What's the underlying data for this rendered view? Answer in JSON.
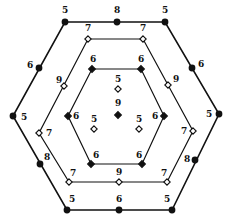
{
  "diagram": {
    "title": "",
    "rings": [
      {
        "name": "outer-hexagon",
        "marker": "filled-circle",
        "vertices": [
          [
            65,
            22
          ],
          [
            165,
            22
          ],
          [
            219,
            114
          ],
          [
            172,
            210
          ],
          [
            67,
            210
          ],
          [
            13,
            116
          ]
        ],
        "nodes": [
          {
            "x": 65,
            "y": 22,
            "label": "5",
            "lx": 62,
            "ly": 13
          },
          {
            "x": 117,
            "y": 22,
            "label": "8",
            "lx": 114,
            "ly": 13
          },
          {
            "x": 165,
            "y": 22,
            "label": "5",
            "lx": 162,
            "ly": 13
          },
          {
            "x": 192,
            "y": 68,
            "label": "6",
            "lx": 198,
            "ly": 67
          },
          {
            "x": 219,
            "y": 114,
            "label": "5",
            "lx": 206,
            "ly": 117
          },
          {
            "x": 195,
            "y": 160,
            "label": "8",
            "lx": 184,
            "ly": 162
          },
          {
            "x": 172,
            "y": 210,
            "label": "5",
            "lx": 164,
            "ly": 202
          },
          {
            "x": 119,
            "y": 210,
            "label": "6",
            "lx": 116,
            "ly": 202
          },
          {
            "x": 67,
            "y": 210,
            "label": "5",
            "lx": 69,
            "ly": 202
          },
          {
            "x": 40,
            "y": 164,
            "label": "8",
            "lx": 44,
            "ly": 160
          },
          {
            "x": 13,
            "y": 116,
            "label": "5",
            "lx": 21,
            "ly": 120
          },
          {
            "x": 39,
            "y": 68,
            "label": "6",
            "lx": 27,
            "ly": 68
          }
        ]
      },
      {
        "name": "middle-hexagon",
        "marker": "open-diamond",
        "vertices": [
          [
            88,
            39
          ],
          [
            143,
            39
          ],
          [
            193,
            131
          ],
          [
            167,
            182
          ],
          [
            69,
            182
          ],
          [
            39,
            133
          ]
        ],
        "nodes": [
          {
            "x": 88,
            "y": 39,
            "label": "7",
            "lx": 85,
            "ly": 31
          },
          {
            "x": 143,
            "y": 39,
            "label": "7",
            "lx": 140,
            "ly": 31
          },
          {
            "x": 168,
            "y": 85,
            "label": "9",
            "lx": 173,
            "ly": 82
          },
          {
            "x": 193,
            "y": 131,
            "label": "7",
            "lx": 181,
            "ly": 134
          },
          {
            "x": 167,
            "y": 182,
            "label": "7",
            "lx": 161,
            "ly": 176
          },
          {
            "x": 119,
            "y": 182,
            "label": "9",
            "lx": 116,
            "ly": 175
          },
          {
            "x": 69,
            "y": 182,
            "label": "7",
            "lx": 70,
            "ly": 176
          },
          {
            "x": 39,
            "y": 133,
            "label": "7",
            "lx": 46,
            "ly": 136
          },
          {
            "x": 64,
            "y": 86,
            "label": "9",
            "lx": 56,
            "ly": 83
          }
        ]
      },
      {
        "name": "inner-hexagon",
        "marker": "filled-diamond",
        "vertices": [
          [
            92,
            69
          ],
          [
            141,
            69
          ],
          [
            164,
            116
          ],
          [
            142,
            164
          ],
          [
            91,
            164
          ],
          [
            68,
            116
          ]
        ],
        "nodes": [
          {
            "x": 92,
            "y": 69,
            "label": "6",
            "lx": 90,
            "ly": 62
          },
          {
            "x": 141,
            "y": 69,
            "label": "6",
            "lx": 138,
            "ly": 62
          },
          {
            "x": 164,
            "y": 116,
            "label": "6",
            "lx": 152,
            "ly": 119
          },
          {
            "x": 142,
            "y": 164,
            "label": "6",
            "lx": 136,
            "ly": 158
          },
          {
            "x": 91,
            "y": 164,
            "label": "6",
            "lx": 93,
            "ly": 158
          },
          {
            "x": 68,
            "y": 116,
            "label": "6",
            "lx": 73,
            "ly": 119
          }
        ]
      }
    ],
    "center_nodes": [
      {
        "x": 118,
        "y": 89,
        "label": "5",
        "marker": "open-diamond",
        "lx": 115,
        "ly": 82
      },
      {
        "x": 118,
        "y": 115,
        "label": "9",
        "marker": "filled-diamond",
        "lx": 115,
        "ly": 106
      },
      {
        "x": 94,
        "y": 129,
        "label": "5",
        "marker": "open-diamond",
        "lx": 91,
        "ly": 122
      },
      {
        "x": 139,
        "y": 129,
        "label": "5",
        "marker": "open-diamond",
        "lx": 136,
        "ly": 122
      }
    ],
    "colors": {
      "stroke": "#111111",
      "fill": "#111111",
      "background": "#ffffff"
    }
  }
}
